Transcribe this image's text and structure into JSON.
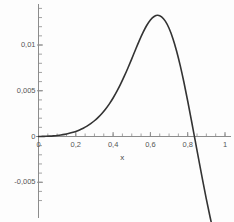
{
  "chart_data": {
    "type": "line",
    "title": "",
    "subtitle": "",
    "xlabel": "x",
    "ylabel": "",
    "xlim": [
      0,
      1
    ],
    "ylim": [
      -0.0078,
      0.0155
    ],
    "grid": false,
    "legend": null,
    "x_ticks": [
      0,
      0.2,
      0.4,
      0.6,
      0.8,
      1
    ],
    "x_tick_labels": [
      "0",
      "0,2",
      "0,4",
      "0,6",
      "0,8",
      "1"
    ],
    "y_ticks": [
      -0.005,
      0,
      0.005,
      0.01
    ],
    "y_tick_labels": [
      "-0,005",
      "0",
      "0,005",
      "0,01"
    ],
    "x_minor_tick_step": 0.05,
    "y_minor_tick_step": 0.001,
    "decimal_separator": ",",
    "series": [
      {
        "name": "curve",
        "color": "#333333",
        "line_width": 1.6,
        "x": [
          0.0,
          0.02,
          0.04,
          0.06,
          0.08,
          0.1,
          0.12,
          0.14,
          0.16,
          0.18,
          0.2,
          0.22,
          0.24,
          0.26,
          0.28,
          0.3,
          0.32,
          0.34,
          0.36,
          0.38,
          0.4,
          0.42,
          0.44,
          0.46,
          0.48,
          0.5,
          0.52,
          0.54,
          0.56,
          0.58,
          0.6,
          0.62,
          0.64,
          0.66,
          0.68,
          0.7,
          0.72,
          0.74,
          0.76,
          0.78,
          0.8,
          0.82,
          0.84,
          0.86,
          0.88,
          0.9,
          0.92,
          0.94,
          0.96,
          0.98,
          1.0
        ],
        "y": [
          0.0,
          1e-05,
          2e-05,
          4e-05,
          7e-05,
          0.00011,
          0.00016,
          0.00023,
          0.00032,
          0.00043,
          0.00056,
          0.00072,
          0.00091,
          0.00114,
          0.00141,
          0.00172,
          0.00209,
          0.00252,
          0.00301,
          0.00357,
          0.00421,
          0.00493,
          0.00572,
          0.00659,
          0.00752,
          0.00849,
          0.00948,
          0.01045,
          0.01135,
          0.01213,
          0.01274,
          0.01312,
          0.01325,
          0.01308,
          0.01261,
          0.01183,
          0.01075,
          0.00938,
          0.00775,
          0.0059,
          0.00388,
          0.00175,
          -0.00043,
          -0.00262,
          -0.00477,
          -0.00684,
          -0.0088,
          -0.01062,
          -0.01228,
          -0.01376,
          -0.01505
        ],
        "peak": {
          "x": 0.61,
          "y": 0.01325
        },
        "zero_crossings": [
          0.0,
          0.888
        ]
      }
    ]
  },
  "axes_style": {
    "axis_color": "#8c8c8c",
    "tick_color": "#8c8c8c",
    "curve_color": "#333333",
    "background": "#fdfdfd",
    "text_color": "#555555"
  }
}
